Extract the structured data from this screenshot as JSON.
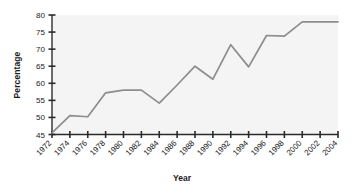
{
  "chart_data": {
    "type": "line",
    "title": "",
    "xlabel": "Year",
    "ylabel": "Percentage",
    "xlim": [
      1972,
      2004
    ],
    "ylim": [
      45,
      80
    ],
    "ytick_labels": [
      "45",
      "50",
      "55",
      "60",
      "65",
      "70",
      "75",
      "80"
    ],
    "ytick_values": [
      45,
      50,
      55,
      60,
      65,
      70,
      75,
      80
    ],
    "xtick_labels": [
      "1972",
      "1974",
      "1976",
      "1978",
      "1980",
      "1982",
      "1984",
      "1986",
      "1988",
      "1990",
      "1992",
      "1994",
      "1996",
      "1998",
      "2000",
      "2002",
      "2004"
    ],
    "x": [
      1972,
      1974,
      1976,
      1978,
      1980,
      1982,
      1984,
      1986,
      1988,
      1990,
      1992,
      1994,
      1996,
      1998,
      2000,
      2002,
      2004
    ],
    "values": [
      45.5,
      50.5,
      50.2,
      57.2,
      58.0,
      58.0,
      54.2,
      59.5,
      65.0,
      61.2,
      71.3,
      64.8,
      74.0,
      73.8,
      78.0,
      78.0,
      78.0
    ],
    "series_color": "#8d8d8d",
    "grid": false,
    "legend": "none"
  }
}
